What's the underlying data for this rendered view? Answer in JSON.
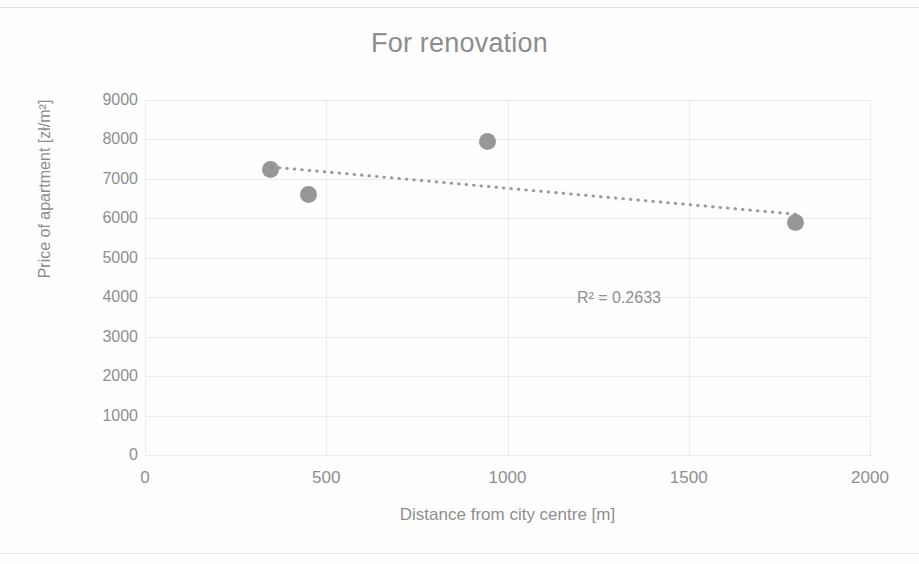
{
  "chart_data": {
    "type": "scatter",
    "title": "For renovation",
    "xlabel": "Distance from city centre [m]",
    "ylabel": "Price of apartment [zł/m²]",
    "xlim": [
      0,
      2000
    ],
    "ylim": [
      0,
      9000
    ],
    "xticks": [
      0,
      500,
      1000,
      1500,
      2000
    ],
    "yticks": [
      0,
      1000,
      2000,
      3000,
      4000,
      5000,
      6000,
      7000,
      8000,
      9000
    ],
    "xtick_labels": [
      "0",
      "500",
      "1000",
      "1500",
      "2000"
    ],
    "ytick_labels": [
      "0",
      "1000",
      "2000",
      "3000",
      "4000",
      "5000",
      "6000",
      "7000",
      "8000",
      "9000"
    ],
    "grid": true,
    "legend": "none",
    "series": [
      {
        "name": "For renovation",
        "marker": "circle",
        "color": "#8e8e8e",
        "points": [
          {
            "x": 345,
            "y": 7250
          },
          {
            "x": 450,
            "y": 6600
          },
          {
            "x": 945,
            "y": 7950
          },
          {
            "x": 1795,
            "y": 5900
          }
        ]
      }
    ],
    "trendline": {
      "type": "linear",
      "style": "dotted",
      "color": "#9a9a9a",
      "x_start": 350,
      "y_start": 7300,
      "x_end": 1800,
      "y_end": 6100,
      "r_squared_label": "R² = 0.2633",
      "r_squared": 0.2633,
      "annotation_x": 1390,
      "annotation_y": 3980
    },
    "colors": {
      "marker": "#8e8e8e",
      "trendline": "#9a9a9a",
      "grid": "#e9ebee",
      "axis": "#d0d2d6",
      "text": "#8e8e8e",
      "title": "#8d8d8d",
      "background": "#fefefe"
    }
  }
}
